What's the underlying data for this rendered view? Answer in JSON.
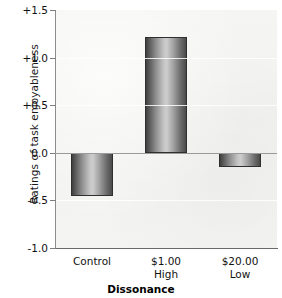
{
  "chart_data": {
    "type": "bar",
    "title": "",
    "subtitle": "",
    "xlabel": "Dissonance",
    "ylabel": "Ratings of task enjoyableness",
    "categories": [
      "Control",
      "$1.00 High",
      "$20.00 Low"
    ],
    "category_lines": [
      {
        "line1": "Control",
        "line2": ""
      },
      {
        "line1": "$1.00",
        "line2": "High"
      },
      {
        "line1": "$20.00",
        "line2": "Low"
      }
    ],
    "values": [
      -0.45,
      1.22,
      -0.15
    ],
    "ylim": [
      -1.0,
      1.5
    ],
    "yticks": [
      1.5,
      1.0,
      0.5,
      0.0,
      -0.5,
      -1.0
    ],
    "ytick_labels": [
      "+1.5",
      "+1.0",
      "+0.5",
      "0.0",
      "-0.5",
      "-1.0"
    ],
    "grid": true,
    "legend": "none",
    "zero_line": 0.0,
    "bar_fill": "#9a9a9a",
    "bar_edge": "#2f2f2f",
    "plot_background": "#f3f3f1",
    "axis_color": "#7d7d7d"
  }
}
